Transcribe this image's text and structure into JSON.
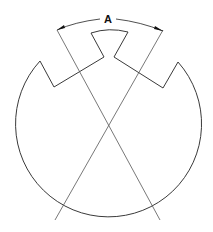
{
  "diagram": {
    "type": "technical-drawing",
    "dimension_label": "A",
    "colors": {
      "background": "#ffffff",
      "outline": "#3a3a3a",
      "construction_lines": "#555555",
      "dimension": "#222222"
    },
    "geometry": {
      "circle_center": [
        108,
        128
      ],
      "circle_radius": 93,
      "profile_points": [
        [
          40,
          61
        ],
        [
          54,
          87
        ],
        [
          104,
          57
        ],
        [
          91,
          33
        ],
        [
          128,
          32
        ],
        [
          114,
          57
        ],
        [
          163,
          88
        ],
        [
          178,
          62
        ]
      ],
      "construction_lines": [
        {
          "from": [
            57,
            30
          ],
          "to": [
            160,
            220
          ]
        },
        {
          "from": [
            163,
            30
          ],
          "to": [
            55,
            220
          ]
        }
      ],
      "dimension_arc": {
        "from": [
          57,
          30
        ],
        "to": [
          163,
          31
        ],
        "label_pos": [
          108,
          19
        ]
      }
    }
  }
}
